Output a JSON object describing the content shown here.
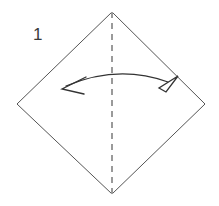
{
  "figure": {
    "kind": "origami-fold-step",
    "background_color": "#ffffff",
    "step_label": "1",
    "step_label_color": "#3a3a3a"
  },
  "shape": {
    "name": "square-rotated-45-diamond",
    "stroke_color": "#555555",
    "stroke_width": 1,
    "fill": "none",
    "vertices": {
      "top": {
        "x": 112,
        "y": 12
      },
      "right": {
        "x": 205,
        "y": 104
      },
      "bottom": {
        "x": 112,
        "y": 194
      },
      "left": {
        "x": 17,
        "y": 104
      }
    }
  },
  "fold_line": {
    "name": "vertical-dashed-fold-line",
    "style": "dashed",
    "color": "#9a9a9a",
    "stroke_width": 2,
    "dash": "6 5",
    "from": {
      "x": 112,
      "y": 12
    },
    "to": {
      "x": 112,
      "y": 194
    }
  },
  "motion_arrow": {
    "name": "double-headed-curved-fold-arrow",
    "color": "#333333",
    "stroke_width": 1.3,
    "arc_start": {
      "x": 66,
      "y": 86
    },
    "arc_control": {
      "x": 118,
      "y": 64
    },
    "arc_end": {
      "x": 168,
      "y": 82
    },
    "left_head": {
      "type": "open-chevron",
      "tip_x": 62,
      "tip_y": 89
    },
    "right_head": {
      "type": "hollow-triangle",
      "tip_x": 178,
      "tip_y": 78
    }
  },
  "labels": {
    "step_number": "1",
    "step_number_position": {
      "x": 33,
      "y": 40
    }
  }
}
